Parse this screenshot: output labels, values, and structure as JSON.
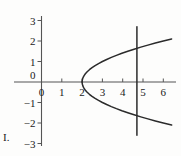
{
  "figure": {
    "label": "I."
  },
  "chart_data": {
    "type": "line",
    "title": "",
    "xlabel": "",
    "ylabel": "",
    "xlim": [
      -0.55,
      6.6
    ],
    "ylim": [
      -3.2,
      3.2
    ],
    "grid": false,
    "legend": null,
    "axis_color": "#555555",
    "curve_color": "#2b2b2b",
    "x_ticks": [
      0,
      1,
      2,
      3,
      4,
      5,
      6
    ],
    "x_tick_labels": [
      "0",
      "1",
      "2",
      "3",
      "4",
      "5",
      "6"
    ],
    "y_ticks": [
      3,
      2,
      1,
      0,
      -1,
      -2,
      -3
    ],
    "y_tick_labels": [
      "3",
      "2",
      "1",
      "0",
      "−1",
      "−2",
      "−3"
    ],
    "series": [
      {
        "name": "parabola-upper",
        "equation": "x = y^2 + 2",
        "x": [
          2.0,
          2.01,
          2.04,
          2.09,
          2.16,
          2.25,
          2.36,
          2.49,
          2.64,
          2.81,
          3.0,
          3.21,
          3.44,
          3.69,
          3.96,
          4.25,
          4.56,
          4.89,
          5.24,
          5.61,
          6.0,
          6.41
        ],
        "y": [
          0.0,
          0.1,
          0.2,
          0.3,
          0.4,
          0.5,
          0.6,
          0.7,
          0.8,
          0.9,
          1.0,
          1.1,
          1.2,
          1.3,
          1.4,
          1.5,
          1.6,
          1.7,
          1.8,
          1.9,
          2.0,
          2.1
        ]
      },
      {
        "name": "parabola-lower",
        "equation": "x = y^2 + 2",
        "x": [
          2.0,
          2.01,
          2.04,
          2.09,
          2.16,
          2.25,
          2.36,
          2.49,
          2.64,
          2.81,
          3.0,
          3.21,
          3.44,
          3.69,
          3.96,
          4.25,
          4.56,
          4.89,
          5.24,
          5.61,
          6.0,
          6.41
        ],
        "y": [
          0.0,
          -0.1,
          -0.2,
          -0.3,
          -0.4,
          -0.5,
          -0.6,
          -0.7,
          -0.8,
          -0.9,
          -1.0,
          -1.1,
          -1.2,
          -1.3,
          -1.4,
          -1.5,
          -1.6,
          -1.7,
          -1.8,
          -1.9,
          -2.0,
          -2.1
        ]
      },
      {
        "name": "vertical-line",
        "equation": "x = 4.7",
        "x": [
          4.7,
          4.7
        ],
        "y": [
          2.7,
          -2.6
        ]
      }
    ],
    "annotations": [
      {
        "name": "vertex",
        "x": 2,
        "y": 0
      }
    ]
  }
}
